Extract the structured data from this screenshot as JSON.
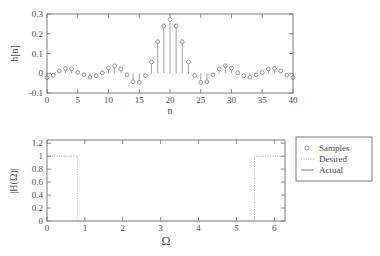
{
  "figure": {
    "title": "",
    "panels": [
      "impulse-response",
      "magnitude-response"
    ]
  },
  "panel_top": {
    "ylabel": "h[n]",
    "xlabel": "n",
    "ytick_labels": [
      "0.3",
      "0.2",
      "0.1",
      "0",
      "-0.1"
    ],
    "xtick_labels": [
      "0",
      "5",
      "10",
      "15",
      "20",
      "25",
      "30",
      "35",
      "40"
    ]
  },
  "panel_bottom": {
    "ylabel": "|H(Ω)|",
    "xlabel": "Ω",
    "ytick_labels": [
      "1.2",
      "1",
      "0.8",
      "0.6",
      "0.4",
      "0.2",
      "0"
    ],
    "xtick_labels": [
      "0",
      "1",
      "2",
      "3",
      "4",
      "5",
      "6"
    ]
  },
  "legend": {
    "items": [
      {
        "label": "Samples",
        "marker": "circle-marker",
        "color": "#6b6b6b"
      },
      {
        "label": "Desired",
        "marker": "dotted-line",
        "color": "#9a9a9a"
      },
      {
        "label": "Actual",
        "marker": "solid-line",
        "color": "#5c5c5c"
      }
    ]
  },
  "chart_data": [
    {
      "type": "stem",
      "title": "",
      "xlabel": "n",
      "ylabel": "h[n]",
      "xlim": [
        0,
        40
      ],
      "ylim": [
        -0.1,
        0.3
      ],
      "xticks": [
        0,
        5,
        10,
        15,
        20,
        25,
        30,
        35,
        40
      ],
      "yticks": [
        -0.1,
        0,
        0.1,
        0.2,
        0.3
      ],
      "grid": false,
      "legend": "none",
      "x": [
        0,
        1,
        2,
        3,
        4,
        5,
        6,
        7,
        8,
        9,
        10,
        11,
        12,
        13,
        14,
        15,
        16,
        17,
        18,
        19,
        20,
        21,
        22,
        23,
        24,
        25,
        26,
        27,
        28,
        29,
        30,
        31,
        32,
        33,
        34,
        35,
        36,
        37,
        38,
        39,
        40
      ],
      "values": [
        -0.022,
        -0.01,
        0.012,
        0.024,
        0.022,
        0.004,
        -0.008,
        -0.02,
        -0.013,
        0.002,
        0.027,
        0.038,
        0.022,
        -0.008,
        -0.043,
        -0.046,
        -0.012,
        0.057,
        0.16,
        0.24,
        0.272,
        0.24,
        0.16,
        0.057,
        -0.012,
        -0.046,
        -0.043,
        -0.008,
        0.022,
        0.038,
        0.027,
        0.002,
        -0.013,
        -0.02,
        -0.008,
        0.004,
        0.022,
        0.024,
        0.012,
        -0.01,
        -0.022
      ]
    },
    {
      "type": "line",
      "title": "",
      "xlabel": "Ω",
      "ylabel": "|H(Ω)|",
      "xlim": [
        0,
        6.2832
      ],
      "ylim": [
        0,
        1.25
      ],
      "xticks": [
        0,
        1,
        2,
        3,
        4,
        5,
        6
      ],
      "yticks": [
        0,
        0.2,
        0.4,
        0.6,
        0.8,
        1.0,
        1.2
      ],
      "grid": false,
      "legend_position": "right-outside",
      "band_edges": {
        "passband_upper": 0.8,
        "stopband_lower": 0.85,
        "stopband_upper": 5.43,
        "passband_lower": 5.48
      },
      "series": [
        {
          "name": "Desired",
          "style": "dotted",
          "x": [
            0,
            0.8,
            0.8,
            5.48,
            5.48,
            6.2832
          ],
          "values": [
            1,
            1,
            0,
            0,
            1,
            1
          ]
        },
        {
          "name": "Actual",
          "style": "solid",
          "comment": "equiripple bandstop magnitude response"
        },
        {
          "name": "Samples",
          "style": "circle",
          "comment": "frequency samples on the actual response"
        }
      ]
    }
  ]
}
